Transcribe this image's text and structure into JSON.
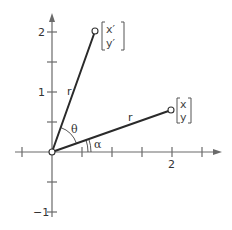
{
  "diagram": {
    "title": "",
    "type": "rotation-of-vector",
    "colors": {
      "axis": "#6a6a6a",
      "vector": "#2a2a2a",
      "text": "#333333"
    },
    "axes": {
      "x_tick_labels": [
        {
          "value": 2,
          "label": "2"
        }
      ],
      "y_tick_labels": [
        {
          "value": 2,
          "label": "2"
        },
        {
          "value": 1,
          "label": "1"
        },
        {
          "value": -1,
          "label": "−1"
        }
      ],
      "tick_spacing": 0.5
    },
    "vectors": [
      {
        "name": "original",
        "length_label": "r",
        "matrix_top": "x",
        "matrix_bottom": "y"
      },
      {
        "name": "rotated",
        "length_label": "r",
        "matrix_top": "x′",
        "matrix_bottom": "y′"
      }
    ],
    "angles": {
      "alpha_label": "α",
      "theta_label": "θ"
    }
  }
}
